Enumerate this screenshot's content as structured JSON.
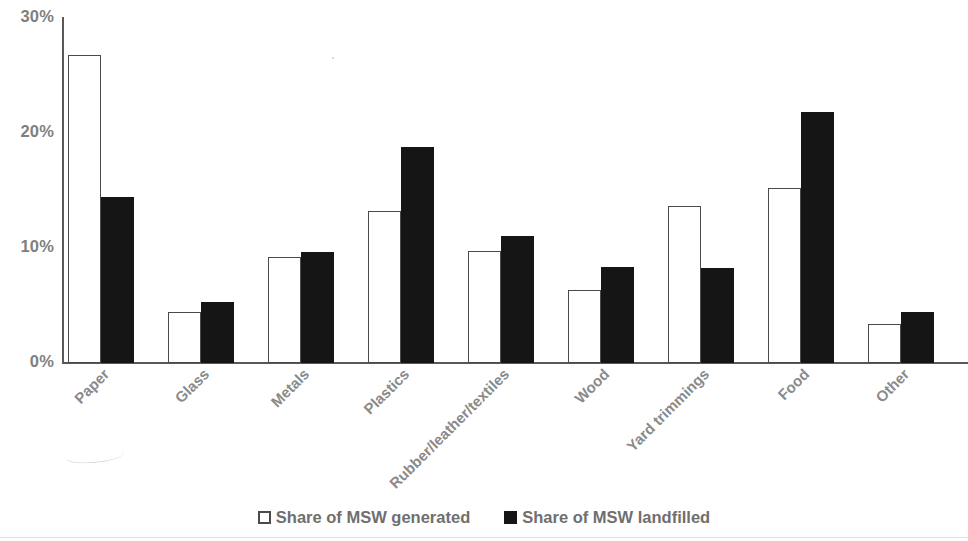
{
  "chart_data": {
    "type": "bar",
    "title": "",
    "subtitle": "",
    "xlabel": "",
    "ylabel": "",
    "categories": [
      "Paper",
      "Glass",
      "Metals",
      "Plastics",
      "Rubber/leather/textiles",
      "Wood",
      "Yard trimmings",
      "Food",
      "Other"
    ],
    "series": [
      {
        "name": "Share of MSW generated",
        "style": "open",
        "values": [
          26.7,
          4.4,
          9.2,
          13.2,
          9.7,
          6.3,
          13.6,
          15.2,
          3.4
        ]
      },
      {
        "name": "Share of MSW landfilled",
        "style": "filled",
        "values": [
          14.4,
          5.3,
          9.6,
          18.7,
          11.0,
          8.3,
          8.2,
          21.8,
          4.4
        ]
      }
    ],
    "ylim": [
      0,
      30
    ],
    "yticks": [
      0,
      10,
      20,
      30
    ],
    "ytick_labels": [
      "0%",
      "10%",
      "20%",
      "30%"
    ],
    "grid": false,
    "legend_position": "bottom",
    "value_format": "percent",
    "x_label_rotation": -45
  },
  "legend": {
    "items": [
      {
        "label": "Share of MSW generated",
        "swatch": "open-square-icon"
      },
      {
        "label": "Share of MSW landfilled",
        "swatch": "filled-square-icon"
      }
    ]
  },
  "axis": {
    "y_tick_labels": [
      "30%",
      "20%",
      "10%",
      "0%"
    ]
  }
}
